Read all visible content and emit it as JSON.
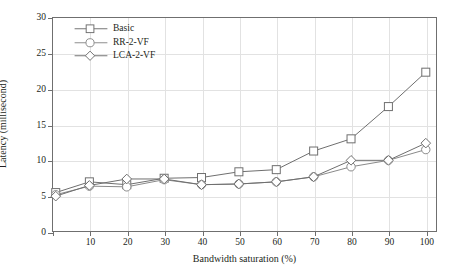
{
  "chart_data": {
    "type": "line",
    "title": "",
    "xlabel": "Bandwidth saturation (%)",
    "ylabel": "Latency (millisecond)",
    "xlim": [
      0,
      103
    ],
    "ylim": [
      0,
      30
    ],
    "xticks": [
      10,
      20,
      30,
      40,
      50,
      60,
      70,
      80,
      90,
      100
    ],
    "yticks": [
      0,
      5,
      10,
      15,
      20,
      25,
      30
    ],
    "grid": true,
    "legend_position": "top-left",
    "x": [
      1,
      10,
      20,
      30,
      40,
      50,
      60,
      70,
      80,
      90,
      100
    ],
    "series": [
      {
        "name": "Basic",
        "marker": "square",
        "color": "#6f6f6f",
        "values": [
          5.5,
          7.0,
          6.6,
          7.5,
          7.6,
          8.4,
          8.7,
          11.3,
          13.0,
          17.5,
          22.3
        ]
      },
      {
        "name": "RR-2-VF",
        "marker": "circle",
        "color": "#8a8a8a",
        "values": [
          5.2,
          6.4,
          6.3,
          7.3,
          6.6,
          6.7,
          7.0,
          7.7,
          9.1,
          10.0,
          11.5
        ]
      },
      {
        "name": "LCA-2-VF",
        "marker": "diamond",
        "color": "#6f6f6f",
        "values": [
          5.0,
          6.5,
          7.4,
          7.4,
          6.6,
          6.7,
          7.0,
          7.7,
          10.0,
          10.0,
          12.4
        ]
      }
    ]
  },
  "legend": {
    "items": [
      {
        "label": "Basic"
      },
      {
        "label": "RR-2-VF"
      },
      {
        "label": "LCA-2-VF"
      }
    ]
  },
  "axes": {
    "y_title": "Latency (millisecond)",
    "x_title": "Bandwidth saturation (%)",
    "y_tick_labels": [
      "0",
      "5",
      "10",
      "15",
      "20",
      "25",
      "30"
    ],
    "x_tick_labels": [
      "10",
      "20",
      "30",
      "40",
      "50",
      "60",
      "70",
      "80",
      "90",
      "100"
    ]
  },
  "colors": {
    "axis": "#6f6f6f",
    "grid": "#e2e2e2",
    "text": "#231f20",
    "series_basic": "#6f6f6f",
    "series_rr": "#8a8a8a",
    "series_lca": "#6f6f6f"
  }
}
